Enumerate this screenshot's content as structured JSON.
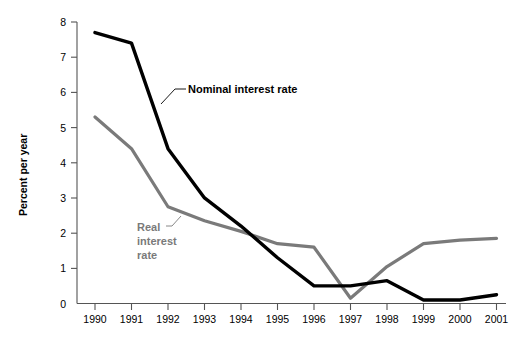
{
  "chart_data": {
    "type": "line",
    "title": "",
    "xlabel": "",
    "ylabel": "Percent per year",
    "categories": [
      "1990",
      "1991",
      "1992",
      "1993",
      "1994",
      "1995",
      "1996",
      "1997",
      "1998",
      "1999",
      "2000",
      "2001"
    ],
    "x": [
      1990,
      1991,
      1992,
      1993,
      1994,
      1995,
      1996,
      1997,
      1998,
      1999,
      2000,
      2001
    ],
    "xlim": [
      1990,
      2001
    ],
    "ylim": [
      0,
      8
    ],
    "yticks": [
      0,
      1,
      2,
      3,
      4,
      5,
      6,
      7,
      8
    ],
    "ytick_labels": [
      "0",
      "1",
      "2",
      "3",
      "4",
      "5",
      "6",
      "7",
      "8"
    ],
    "grid": false,
    "legend_position": "inline-annotations",
    "series": [
      {
        "name": "Nominal interest rate",
        "color": "#000000",
        "values": [
          7.7,
          7.4,
          4.4,
          3.0,
          2.2,
          1.3,
          0.5,
          0.5,
          0.65,
          0.1,
          0.1,
          0.25
        ]
      },
      {
        "name": "Real interest rate",
        "color": "#7a7a7a",
        "values": [
          5.3,
          4.4,
          2.75,
          2.35,
          2.05,
          1.7,
          1.6,
          0.15,
          1.05,
          1.7,
          1.8,
          1.85
        ]
      }
    ],
    "annotations": [
      {
        "text": "Nominal interest rate",
        "series": "Nominal interest rate",
        "color": "#000000"
      },
      {
        "text": "Real interest rate",
        "series": "Real interest rate",
        "color": "#7a7a7a"
      }
    ]
  },
  "labels": {
    "y_axis_title": "Percent per year",
    "nominal_label": "Nominal interest rate",
    "real_label_line1": "Real",
    "real_label_line2": "interest",
    "real_label_line3": "rate"
  },
  "colors": {
    "nominal": "#000000",
    "real": "#7a7a7a",
    "axis": "#555555",
    "background": "#ffffff"
  }
}
